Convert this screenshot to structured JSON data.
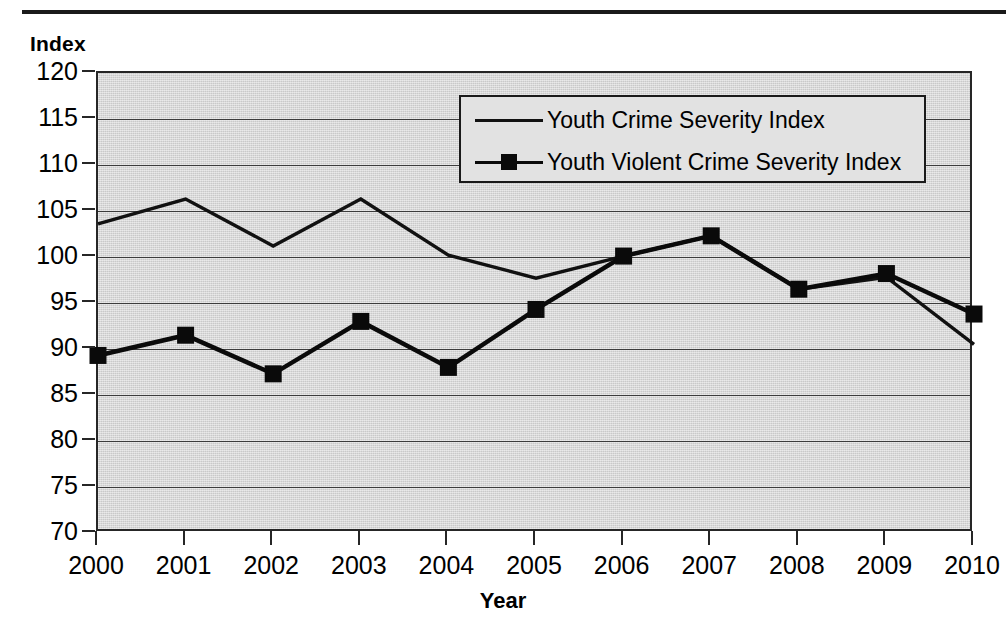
{
  "figure": {
    "y_axis_caption": "Index",
    "x_axis_caption": "Year"
  },
  "legend": {
    "entries": [
      {
        "label": "Youth Crime Severity Index",
        "marker": "none",
        "color": "#111111"
      },
      {
        "label": "Youth Violent Crime Severity Index",
        "marker": "square",
        "color": "#0a0a0a"
      }
    ]
  },
  "chart_data": {
    "type": "line",
    "title": "",
    "subtitle": "",
    "xlabel": "Year",
    "ylabel": "Index",
    "grid": true,
    "legend_position": "top-right-inside",
    "x": [
      2000,
      2001,
      2002,
      2003,
      2004,
      2005,
      2006,
      2007,
      2008,
      2009,
      2010
    ],
    "categories": [
      "2000",
      "2001",
      "2002",
      "2003",
      "2004",
      "2005",
      "2006",
      "2007",
      "2008",
      "2009",
      "2010"
    ],
    "xlim": [
      2000,
      2010
    ],
    "ylim": [
      70,
      120
    ],
    "yticks": [
      70,
      75,
      80,
      85,
      90,
      95,
      100,
      105,
      110,
      115,
      120
    ],
    "ytick_labels": [
      "70",
      "75",
      "80",
      "85",
      "90",
      "95",
      "100",
      "105",
      "110",
      "115",
      "120"
    ],
    "series": [
      {
        "name": "Youth Crime Severity Index",
        "marker": "none",
        "color": "#111111",
        "values": [
          103.6,
          106.3,
          101.2,
          106.3,
          100.2,
          97.7,
          100.1,
          102.3,
          96.5,
          97.8,
          90.5
        ]
      },
      {
        "name": "Youth Violent Crime Severity Index",
        "marker": "square",
        "color": "#0a0a0a",
        "values": [
          89.3,
          91.5,
          87.3,
          93.0,
          88.0,
          94.3,
          100.1,
          102.3,
          96.5,
          98.2,
          93.8
        ]
      }
    ]
  }
}
